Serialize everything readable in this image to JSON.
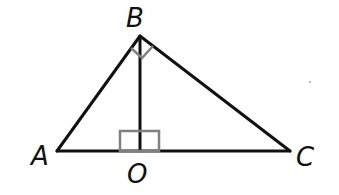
{
  "diagram": {
    "title": "",
    "type": "geometry",
    "colors": {
      "stroke": "#111111",
      "right_angle_mark": "#808080",
      "background": "#ffffff"
    },
    "points": [
      {
        "name": "A",
        "label": "A",
        "x": 57,
        "y": 151
      },
      {
        "name": "B",
        "label": "B",
        "x": 140,
        "y": 36
      },
      {
        "name": "C",
        "label": "C",
        "x": 290,
        "y": 151
      },
      {
        "name": "O",
        "label": "O",
        "x": 140,
        "y": 151
      }
    ],
    "segments": [
      "AB",
      "BC",
      "AC",
      "BO"
    ],
    "right_angles": [
      {
        "at": "B",
        "between": [
          "BA",
          "BC"
        ]
      },
      {
        "at": "O",
        "between": [
          "OB",
          "OA"
        ]
      },
      {
        "at": "O",
        "between": [
          "OB",
          "OC"
        ]
      }
    ],
    "labels": {
      "A": "A",
      "B": "B",
      "C": "C",
      "O": "O"
    }
  }
}
